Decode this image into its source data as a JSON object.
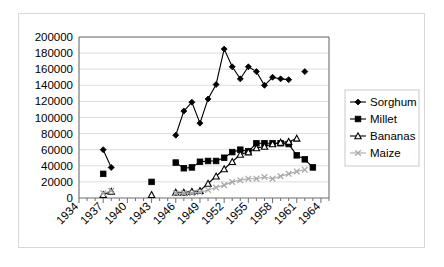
{
  "chart_data": {
    "type": "line",
    "title": "",
    "xlabel": "",
    "ylabel": "",
    "xlim": [
      1934,
      1965
    ],
    "ylim": [
      0,
      200000
    ],
    "grid": true,
    "legend_position": "right",
    "y_ticks": [
      0,
      20000,
      40000,
      60000,
      80000,
      100000,
      120000,
      140000,
      160000,
      180000,
      200000
    ],
    "y_tick_labels": [
      "0",
      "20000",
      "40000",
      "60000",
      "80000",
      "100000",
      "120000",
      "140000",
      "160000",
      "180000",
      "200000"
    ],
    "x_ticks": [
      1934,
      1937,
      1940,
      1943,
      1946,
      1949,
      1952,
      1955,
      1958,
      1961,
      1964
    ],
    "x_tick_labels": [
      "1934",
      "1937",
      "1940",
      "1943",
      "1946",
      "1949",
      "1952",
      "1955",
      "1958",
      "1961",
      "1964"
    ],
    "x_minor_tick_step": 1,
    "series": [
      {
        "name": "Sorghum",
        "marker": "filled-diamond",
        "color": "#000000",
        "segments": [
          {
            "x": [
              1937,
              1938
            ],
            "y": [
              60000,
              38000
            ]
          },
          {
            "x": [
              1946,
              1947,
              1948,
              1949,
              1950,
              1951,
              1952,
              1953,
              1954,
              1955,
              1956,
              1957,
              1958,
              1959,
              1960
            ],
            "y": [
              78000,
              108000,
              119000,
              93000,
              123000,
              141000,
              185000,
              163000,
              148000,
              163000,
              157000,
              140000,
              150000,
              148000,
              147000
            ]
          },
          {
            "x": [
              1962
            ],
            "y": [
              157000
            ]
          }
        ]
      },
      {
        "name": "Millet",
        "marker": "filled-square",
        "color": "#000000",
        "segments": [
          {
            "x": [
              1937
            ],
            "y": [
              30000
            ]
          },
          {
            "x": [
              1943
            ],
            "y": [
              20000
            ]
          },
          {
            "x": [
              1946,
              1947,
              1948,
              1949,
              1950,
              1951,
              1952,
              1953,
              1954,
              1955,
              1956,
              1957,
              1958,
              1959,
              1960,
              1961,
              1962,
              1963
            ],
            "y": [
              44000,
              37000,
              38000,
              45000,
              46000,
              46000,
              50000,
              57000,
              60000,
              58000,
              68000,
              68000,
              68000,
              68000,
              67000,
              53000,
              48000,
              38000
            ]
          }
        ]
      },
      {
        "name": "Bananas",
        "marker": "open-triangle",
        "color": "#000000",
        "segments": [
          {
            "x": [
              1937,
              1938
            ],
            "y": [
              4000,
              8000
            ]
          },
          {
            "x": [
              1943
            ],
            "y": [
              4000
            ]
          },
          {
            "x": [
              1946,
              1947,
              1948,
              1949,
              1950,
              1951,
              1952,
              1953,
              1954,
              1955,
              1956,
              1957,
              1958,
              1959,
              1960,
              1961
            ],
            "y": [
              7000,
              7000,
              8000,
              9000,
              18000,
              27000,
              36000,
              45000,
              54000,
              57000,
              62000,
              64000,
              67000,
              69000,
              70000,
              74000
            ]
          }
        ]
      },
      {
        "name": "Maize",
        "marker": "gray-cross",
        "color": "#a9a9a9",
        "segments": [
          {
            "x": [
              1937,
              1938
            ],
            "y": [
              6000,
              9000
            ]
          },
          {
            "x": [
              1946,
              1947,
              1948,
              1949,
              1950,
              1951,
              1952,
              1953,
              1954,
              1955,
              1956,
              1957,
              1958,
              1959,
              1960,
              1961,
              1962
            ],
            "y": [
              6000,
              6000,
              6000,
              7000,
              10000,
              13000,
              16000,
              20000,
              22000,
              24000,
              24000,
              26000,
              24000,
              27000,
              30000,
              33000,
              35000
            ]
          }
        ]
      }
    ]
  },
  "legend": {
    "items": [
      {
        "label": "Sorghum",
        "marker": "filled-diamond"
      },
      {
        "label": "Millet",
        "marker": "filled-square"
      },
      {
        "label": "Bananas",
        "marker": "open-triangle"
      },
      {
        "label": "Maize",
        "marker": "gray-cross"
      }
    ]
  }
}
